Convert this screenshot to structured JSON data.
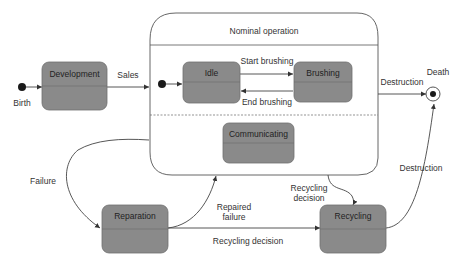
{
  "diagram": {
    "type": "uml-state-machine",
    "colors": {
      "state_fill": "#8a8a8a",
      "state_stroke": "#6e6e6e",
      "edge": "#444444",
      "composite_stroke": "#555555",
      "background": "#ffffff"
    },
    "composite": {
      "title": "Nominal operation"
    },
    "states": {
      "development": "Development",
      "idle": "Idle",
      "brushing": "Brushing",
      "communicating": "Communicating",
      "reparation": "Reparation",
      "recycling": "Recycling"
    },
    "pseudostates": {
      "birth": "Birth",
      "death": "Death"
    },
    "transitions": {
      "sales": "Sales",
      "start_brushing": "Start brushing",
      "end_brushing": "End brushing",
      "destruction_top": "Destruction",
      "failure": "Failure",
      "repaired_failure_line1": "Repaired",
      "repaired_failure_line2": "failure",
      "recycling_decision_line1": "Recycling",
      "recycling_decision_line2": "decision",
      "recycling_decision_bottom": "Recycling decision",
      "destruction_right": "Destruction"
    }
  }
}
